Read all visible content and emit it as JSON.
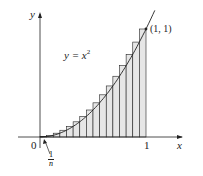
{
  "diagram": {
    "curve_label": "y = x",
    "curve_exponent": "2",
    "point_label": "(1, 1)",
    "origin_label": "0",
    "x_tick_label": "1",
    "x_axis_label": "x",
    "y_axis_label": "y",
    "width_label_num": "1",
    "width_label_den": "n",
    "n_rectangles": 16,
    "colors": {
      "fill": "#e6e6e6",
      "stroke": "#222222"
    }
  },
  "chart_data": {
    "type": "area",
    "function": "x^2",
    "xlim": [
      0,
      1
    ],
    "ylim": [
      0,
      1
    ],
    "n": 16,
    "x": [
      0.0625,
      0.125,
      0.1875,
      0.25,
      0.3125,
      0.375,
      0.4375,
      0.5,
      0.5625,
      0.625,
      0.6875,
      0.75,
      0.8125,
      0.875,
      0.9375,
      1.0
    ],
    "values": [
      0.0039,
      0.0156,
      0.0352,
      0.0625,
      0.0977,
      0.1406,
      0.1914,
      0.25,
      0.3164,
      0.3906,
      0.4727,
      0.5625,
      0.6602,
      0.7656,
      0.8789,
      1.0
    ],
    "annotations": [
      "y = x^2",
      "(1, 1)",
      "1/n",
      "0",
      "1"
    ],
    "xlabel": "x",
    "ylabel": "y"
  }
}
